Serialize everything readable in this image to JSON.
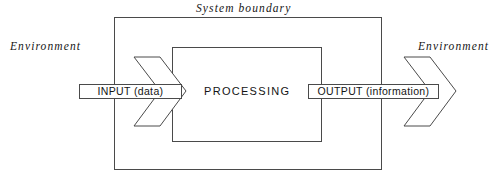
{
  "diagram": {
    "title": "System boundary",
    "type": "block-flow-diagram",
    "labels": {
      "environment_left": "Environment",
      "environment_right": "Environment",
      "system_boundary": "System boundary",
      "processing": "PROCESSING",
      "input": "INPUT (data)",
      "output": "OUTPUT (information)"
    },
    "colors": {
      "stroke": "#4a4a4a",
      "text": "#141414",
      "background": "#ffffff"
    },
    "shapes": {
      "outer_boundary": {
        "name": "system-boundary-box",
        "x": 114,
        "y": 17,
        "width": 268,
        "height": 153
      },
      "inner_box": {
        "name": "processing-box",
        "x": 172,
        "y": 47,
        "width": 150,
        "height": 95
      },
      "input_arrow": {
        "name": "input-arrow",
        "direction": "right"
      },
      "output_arrow": {
        "name": "output-arrow",
        "direction": "right"
      }
    }
  }
}
